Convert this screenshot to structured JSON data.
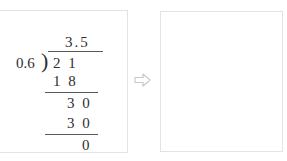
{
  "doc": {
    "type": "long-division-worksheet",
    "description": "Worked long division example with an empty answer panel"
  },
  "left_panel": {
    "name": "worked-example-panel",
    "division": {
      "quotient": "3.5",
      "divisor": "0.6",
      "bracket": ")",
      "dividend": "2 1",
      "steps": [
        {
          "label": "subtract-1",
          "value": "1 8"
        },
        {
          "label": "bring-down",
          "value": "3 0"
        },
        {
          "label": "subtract-2",
          "value": "3 0"
        }
      ],
      "remainder": "0"
    }
  },
  "arrow": {
    "name": "right-arrow-icon",
    "glyph": "right-arrow",
    "color": "#c9c9c9"
  },
  "right_panel": {
    "name": "answer-panel",
    "content": ""
  },
  "colors": {
    "panel_border": "#e3e3e3",
    "ink": "#2e2e2e",
    "rule": "#5a5a5a",
    "background": "#ffffff",
    "arrow_stroke": "#c9c9c9"
  }
}
